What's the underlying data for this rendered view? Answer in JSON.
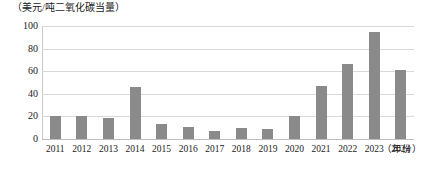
{
  "chart_data": {
    "type": "bar",
    "title": "",
    "subtitle": "",
    "xlabel": "（年份）",
    "ylabel": "（美元/吨二氧化碳当量）",
    "categories": [
      "2011",
      "2012",
      "2013",
      "2014",
      "2015",
      "2016",
      "2017",
      "2018",
      "2019",
      "2020",
      "2021",
      "2022",
      "2023",
      "2024"
    ],
    "values": [
      20,
      20,
      19,
      46,
      13,
      11,
      7,
      10,
      9,
      20,
      47,
      66,
      95,
      61
    ],
    "series": [
      {
        "name": "碳价",
        "values": [
          20,
          20,
          19,
          46,
          13,
          11,
          7,
          10,
          9,
          20,
          47,
          66,
          95,
          61
        ]
      }
    ],
    "ylim": [
      0,
      100
    ],
    "yticks": [
      100,
      80,
      60,
      40,
      20,
      0
    ],
    "ytick_labels": [
      "100",
      "80",
      "60",
      "40",
      "20",
      "0"
    ],
    "grid": true,
    "legend": false,
    "legend_position": "none",
    "bar_color": "#8a8a8a",
    "gridline_color": "#d9d9d9",
    "axis_color": "#c9c9c9",
    "text_color": "#1a1a1a"
  }
}
